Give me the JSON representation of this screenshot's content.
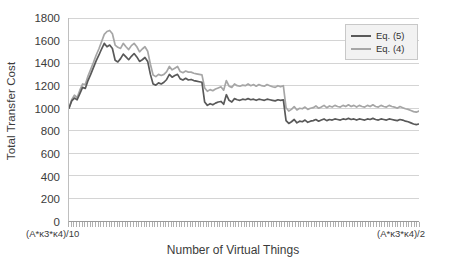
{
  "chart_data": {
    "type": "line",
    "title": "",
    "xlabel": "Number of Virtual Things",
    "ylabel": "Total Transfer Cost",
    "ylim": [
      0,
      1800
    ],
    "ytick_labels": [
      "0",
      "200",
      "400",
      "600",
      "800",
      "1000",
      "1200",
      "1400",
      "1600",
      "1800"
    ],
    "yticks": [
      0,
      200,
      400,
      600,
      800,
      1000,
      1200,
      1400,
      1600,
      1800
    ],
    "grid": "horizontal",
    "x_axis_start_label": "(A*κ3*κ4)/10",
    "x_axis_end_label": "(A*κ3*κ4)/2",
    "legend_position": "top-right",
    "series": [
      {
        "name": "Eq. (5)",
        "color": "#595959",
        "values": [
          1000,
          1065,
          1090,
          1075,
          1130,
          1185,
          1175,
          1245,
          1300,
          1360,
          1420,
          1470,
          1525,
          1575,
          1545,
          1560,
          1530,
          1425,
          1410,
          1440,
          1480,
          1455,
          1430,
          1460,
          1485,
          1455,
          1415,
          1430,
          1450,
          1415,
          1300,
          1215,
          1205,
          1225,
          1215,
          1230,
          1255,
          1300,
          1275,
          1290,
          1300,
          1260,
          1250,
          1265,
          1250,
          1255,
          1245,
          1240,
          1235,
          1230,
          1055,
          1025,
          1040,
          1030,
          1045,
          1055,
          1060,
          1035,
          1120,
          1070,
          1055,
          1085,
          1075,
          1070,
          1080,
          1075,
          1085,
          1075,
          1080,
          1070,
          1080,
          1075,
          1070,
          1080,
          1075,
          1070,
          1065,
          1075,
          1070,
          1075,
          890,
          865,
          880,
          900,
          870,
          885,
          880,
          895,
          875,
          885,
          890,
          900,
          885,
          895,
          905,
          890,
          900,
          895,
          905,
          900,
          895,
          905,
          900,
          910,
          900,
          905,
          895,
          905,
          900,
          895,
          905,
          900,
          910,
          900,
          895,
          905,
          900,
          895,
          905,
          900,
          895,
          890,
          900,
          895,
          885,
          880,
          870,
          860,
          855,
          860
        ]
      },
      {
        "name": "Eq. (4)",
        "color": "#a6a6a6",
        "values": [
          1000,
          1075,
          1115,
          1095,
          1160,
          1215,
          1210,
          1285,
          1345,
          1405,
          1470,
          1525,
          1590,
          1655,
          1680,
          1690,
          1660,
          1560,
          1540,
          1530,
          1575,
          1545,
          1520,
          1555,
          1575,
          1545,
          1500,
          1525,
          1545,
          1505,
          1390,
          1295,
          1280,
          1300,
          1290,
          1300,
          1325,
          1370,
          1340,
          1355,
          1370,
          1325,
          1315,
          1330,
          1320,
          1320,
          1310,
          1305,
          1300,
          1295,
          1180,
          1150,
          1165,
          1155,
          1170,
          1180,
          1190,
          1160,
          1245,
          1195,
          1185,
          1215,
          1200,
          1195,
          1205,
          1200,
          1215,
          1200,
          1210,
          1195,
          1210,
          1200,
          1195,
          1210,
          1200,
          1190,
          1185,
          1200,
          1190,
          1200,
          1005,
          975,
          990,
          1015,
          985,
          1000,
          995,
          1010,
          990,
          1000,
          1005,
          1020,
          1000,
          1010,
          1025,
          1005,
          1020,
          1010,
          1025,
          1015,
          1010,
          1025,
          1015,
          1030,
          1015,
          1025,
          1010,
          1025,
          1015,
          1010,
          1025,
          1015,
          1030,
          1015,
          1010,
          1025,
          1015,
          1010,
          1025,
          1015,
          1010,
          1000,
          1015,
          1005,
          995,
          990,
          980,
          970,
          965,
          975
        ]
      }
    ]
  }
}
